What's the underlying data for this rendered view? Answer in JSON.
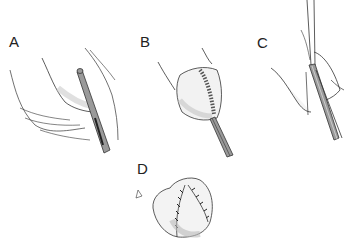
{
  "figure": {
    "panels": [
      {
        "id": "A",
        "label": "A",
        "description": "Probe inserted alongside tissue fold"
      },
      {
        "id": "B",
        "label": "B",
        "description": "Stapled/sutured line with instrument below"
      },
      {
        "id": "C",
        "label": "C",
        "description": "Forceps-like instrument grasping tissue flap"
      },
      {
        "id": "D",
        "label": "D",
        "description": "Closed tissue with interrupted sutures"
      }
    ],
    "colors": {
      "line": "#333333",
      "instrument_fill": "#9a9a9a",
      "shading": "#cfcfcf",
      "background": "#ffffff"
    }
  }
}
